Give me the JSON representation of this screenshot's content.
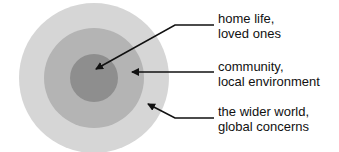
{
  "diagram": {
    "type": "concentric-circles",
    "circles": [
      {
        "name": "outer",
        "color": "#d6d6d6"
      },
      {
        "name": "middle",
        "color": "#b4b4b4"
      },
      {
        "name": "inner",
        "color": "#8e8e8e"
      }
    ],
    "labels": [
      {
        "line1": "home life,",
        "line2": "loved ones",
        "target": "inner"
      },
      {
        "line1": "community,",
        "line2": "local environment",
        "target": "middle"
      },
      {
        "line1": "the wider world,",
        "line2": "global concerns",
        "target": "outer"
      }
    ],
    "arrow_color": "#111111"
  }
}
